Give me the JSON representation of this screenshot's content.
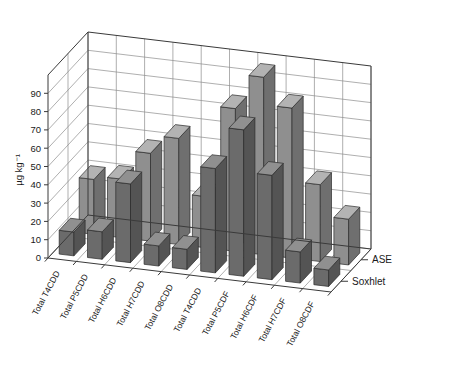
{
  "chart_data": {
    "type": "bar",
    "render": "3d-grouped-bar",
    "title": "",
    "xlabel": "",
    "ylabel": "µg kg⁻¹",
    "ylim": [
      0,
      100
    ],
    "yticks": [
      0,
      10,
      20,
      30,
      40,
      50,
      60,
      70,
      80,
      90
    ],
    "ytick_labels": [
      "0",
      "10",
      "20",
      "30",
      "40",
      "50",
      "60",
      "70",
      "80",
      "90"
    ],
    "grid": true,
    "legend_position": "right-depth-axis",
    "categories": [
      "Total T4CDD",
      "Total P5CDD",
      "Total H6CDD",
      "Total H7CDD",
      "Total O8CDD",
      "Total T4CDD",
      "Total P5CDF",
      "Total H6CDF",
      "Total H7CDF",
      "Total O8CDF"
    ],
    "series": [
      {
        "name": "ASE",
        "color": "#8f8f8f",
        "top_color": "#b3b3b3",
        "side_color": "#6f6f6f",
        "values": [
          30,
          32,
          48,
          58,
          28,
          78,
          97,
          82,
          42,
          25
        ]
      },
      {
        "name": "Soxhlet",
        "color": "#6b6b6b",
        "top_color": "#909090",
        "side_color": "#545454",
        "values": [
          13,
          15,
          43,
          11,
          11,
          57,
          80,
          57,
          17,
          9
        ]
      }
    ]
  },
  "axes": {
    "y_axis_label": "µg kg⁻¹",
    "depth_labels": [
      "ASE",
      "Soxhlet"
    ]
  }
}
